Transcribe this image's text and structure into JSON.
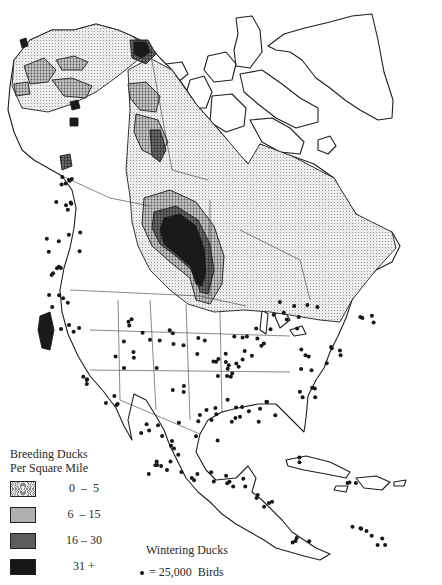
{
  "map": {
    "subject": "North America: breeding and wintering ducks",
    "colors": {
      "land": "#ffffff",
      "line": "#1e1e1e",
      "class_0_5": "#e3e3e3",
      "class_6_15": "#b3b3b3",
      "class_16_30": "#6e6e6e",
      "class_31_plus": "#1a1a1a",
      "wintering_dot": "#161616"
    }
  },
  "legend": {
    "breeding": {
      "title_line1": "Breeding Ducks",
      "title_line2": "Per Square Mile",
      "classes": [
        {
          "label": "0  –  5",
          "range": [
            0,
            5
          ],
          "fill": "light stipple"
        },
        {
          "label": "6  – 15",
          "range": [
            6,
            15
          ],
          "fill": "medium stipple"
        },
        {
          "label": "16 – 30",
          "range": [
            16,
            30
          ],
          "fill": "dark stipple"
        },
        {
          "label": "31 +",
          "range": [
            31,
            null
          ],
          "fill": "solid black"
        }
      ]
    },
    "wintering": {
      "title": "Wintering Ducks",
      "symbol": "dot-icon",
      "label": "= 25,000  Birds",
      "birds_per_dot": 25000
    }
  }
}
